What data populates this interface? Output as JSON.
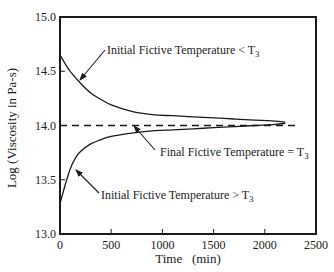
{
  "chart_data": {
    "type": "line",
    "title": "",
    "xlabel": "Time   (min)",
    "ylabel": "Log (Viscosity in Pa-s)",
    "xlim": [
      0,
      2500
    ],
    "ylim": [
      13.0,
      15.0
    ],
    "xticks": [
      0,
      500,
      1000,
      1500,
      2000,
      2500
    ],
    "xtick_labels": [
      "0",
      "500",
      "1000",
      "1500",
      "2000",
      "2500"
    ],
    "yticks": [
      13.0,
      13.5,
      14.0,
      14.5,
      15.0
    ],
    "ytick_labels": [
      "13.0",
      "13.5",
      "14.0",
      "14.5",
      "15.0"
    ],
    "grid": false,
    "legend": null,
    "series": [
      {
        "name": "Initial Fictive Temperature < T3",
        "style": "solid",
        "x": [
          0,
          50,
          100,
          200,
          300,
          400,
          500,
          700,
          900,
          1100,
          1300,
          1500,
          1700,
          1900,
          2100,
          2200
        ],
        "values": [
          14.65,
          14.57,
          14.5,
          14.39,
          14.3,
          14.24,
          14.19,
          14.13,
          14.1,
          14.09,
          14.08,
          14.07,
          14.06,
          14.05,
          14.04,
          14.03
        ]
      },
      {
        "name": "Initial Fictive Temperature > T3",
        "style": "solid",
        "x": [
          0,
          50,
          100,
          150,
          200,
          300,
          400,
          500,
          700,
          900,
          1100,
          1300,
          1500,
          1700,
          1900,
          2100,
          2200
        ],
        "values": [
          13.28,
          13.45,
          13.6,
          13.7,
          13.76,
          13.83,
          13.87,
          13.9,
          13.93,
          13.95,
          13.96,
          13.97,
          13.98,
          13.99,
          14.0,
          14.01,
          14.02
        ]
      },
      {
        "name": "Final Fictive Temperature = T3",
        "style": "dashed",
        "x": [
          0,
          2300
        ],
        "values": [
          14.0,
          14.0
        ]
      }
    ],
    "annotations": [
      {
        "text": "Initial Fictive Temperature < T",
        "sub": "3",
        "x": 107,
        "y": 54,
        "arrow": [
          105,
          50,
          80,
          80
        ]
      },
      {
        "text": "Final Fictive Temperature = T",
        "sub": "3",
        "x": 160,
        "y": 156,
        "arrow": [
          155,
          150,
          134,
          126
        ]
      },
      {
        "text": "Initial Fictive Temperature > T",
        "sub": "3",
        "x": 101,
        "y": 199,
        "arrow": [
          99,
          193,
          76,
          170
        ]
      }
    ]
  },
  "labels": {
    "ylabel": "Log (Viscosity in Pa-s)",
    "xlabel": "Time   (min)",
    "ann_upper": "Initial Fictive Temperature < T",
    "ann_final": "Final Fictive Temperature = T",
    "ann_lower": "Initial Fictive Temperature > T",
    "sub3": "3"
  }
}
